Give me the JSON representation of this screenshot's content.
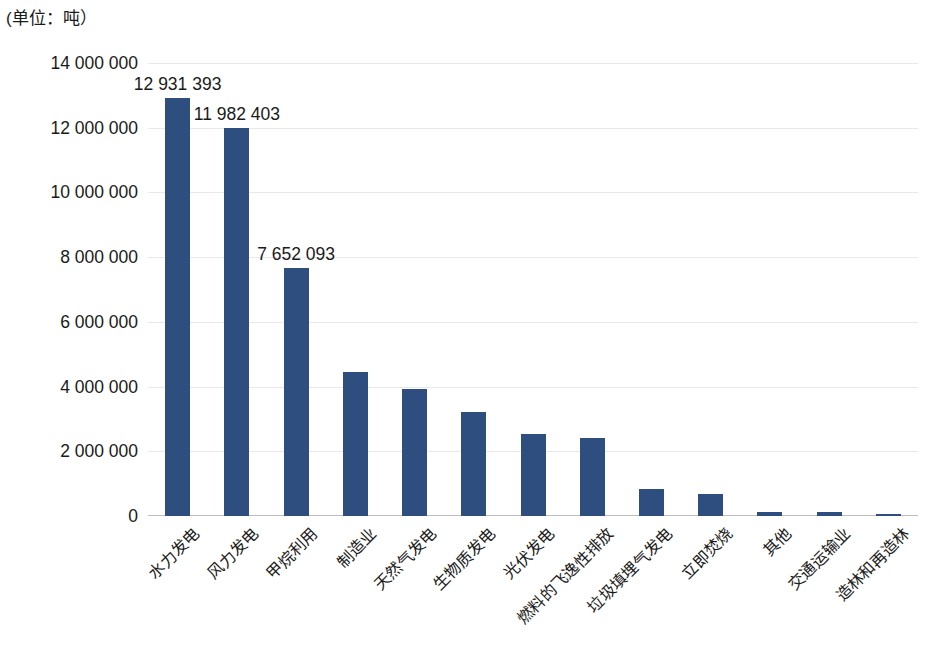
{
  "caption": {
    "unit_label": "(单位：吨）"
  },
  "chart_data": {
    "type": "bar",
    "title": "",
    "subtitle": "",
    "xlabel": "",
    "ylabel": "",
    "unit_note": "(单位：吨）",
    "ylim": [
      0,
      14000000
    ],
    "ytick_labels": [
      "14 000 000",
      "12 000 000",
      "10 000 000",
      "8 000 000",
      "6 000 000",
      "4 000 000",
      "2 000 000",
      "0"
    ],
    "ytick_values": [
      14000000,
      12000000,
      10000000,
      8000000,
      6000000,
      4000000,
      2000000,
      0
    ],
    "grid": true,
    "legend": "none",
    "bar_color": "#2E4E80",
    "categories": [
      "水力发电",
      "风力发电",
      "甲烷利用",
      "制造业",
      "天然气发电",
      "生物质发电",
      "光伏发电",
      "燃料的飞逸性排放",
      "垃圾填埋气发电",
      "立即焚烧",
      "其他",
      "交通运输业",
      "造林和再造林"
    ],
    "values": [
      12931393,
      11982403,
      7652093,
      4450000,
      3920000,
      3210000,
      2550000,
      2400000,
      840000,
      690000,
      110000,
      130000,
      30000
    ],
    "data_labels": [
      "12 931 393",
      "11 982 403",
      "7 652 093",
      "",
      "",
      "",
      "",
      "",
      "",
      "",
      "",
      "",
      ""
    ]
  }
}
